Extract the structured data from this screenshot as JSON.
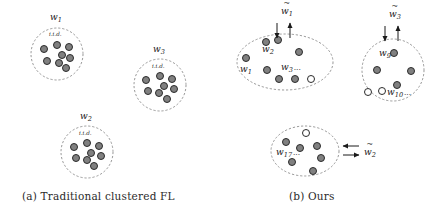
{
  "figure": {
    "type": "diagram",
    "colors": {
      "node_fill": "#808080",
      "node_stroke": "#2b2b2b",
      "node_fill_empty": "#ffffff",
      "boundary_stroke": "#8c8c8c",
      "text": "#1a1a1a",
      "background": "#ffffff"
    }
  },
  "panels": [
    {
      "id": "a",
      "caption": "(a) Traditional clustered FL",
      "clusters": [
        {
          "name": "cluster-w1",
          "label": "w",
          "subscript": "1",
          "inner_label": "i.i.d.",
          "shape": "circle",
          "cx": 57,
          "cy": 54,
          "rx": 26,
          "ry": 26,
          "label_x": 50,
          "label_y": 20,
          "inner_label_x": 49,
          "inner_label_y": 36,
          "nodes": [
            {
              "x": 44,
              "y": 49,
              "fill": "gray"
            },
            {
              "x": 57,
              "y": 45,
              "fill": "gray"
            },
            {
              "x": 69,
              "y": 47,
              "fill": "gray"
            },
            {
              "x": 62,
              "y": 55,
              "fill": "gray"
            },
            {
              "x": 47,
              "y": 61,
              "fill": "gray"
            },
            {
              "x": 59,
              "y": 63,
              "fill": "gray"
            },
            {
              "x": 70,
              "y": 58,
              "fill": "gray"
            },
            {
              "x": 66,
              "y": 68,
              "fill": "gray"
            }
          ]
        },
        {
          "name": "cluster-w3",
          "label": "w",
          "subscript": "3",
          "inner_label": "i.i.d.",
          "shape": "circle",
          "cx": 160,
          "cy": 85,
          "rx": 26,
          "ry": 26,
          "label_x": 153,
          "label_y": 52,
          "inner_label_x": 152,
          "inner_label_y": 68,
          "nodes": [
            {
              "x": 146,
              "y": 80,
              "fill": "gray"
            },
            {
              "x": 160,
              "y": 76,
              "fill": "gray"
            },
            {
              "x": 172,
              "y": 79,
              "fill": "gray"
            },
            {
              "x": 164,
              "y": 86,
              "fill": "gray"
            },
            {
              "x": 148,
              "y": 91,
              "fill": "gray"
            },
            {
              "x": 159,
              "y": 93,
              "fill": "gray"
            },
            {
              "x": 174,
              "y": 89,
              "fill": "gray"
            },
            {
              "x": 167,
              "y": 99,
              "fill": "gray"
            }
          ]
        },
        {
          "name": "cluster-w2",
          "label": "w",
          "subscript": "2",
          "inner_label": "i.i.d.",
          "shape": "circle",
          "cx": 87,
          "cy": 152,
          "rx": 26,
          "ry": 26,
          "label_x": 80,
          "label_y": 119,
          "inner_label_x": 79,
          "inner_label_y": 135,
          "nodes": [
            {
              "x": 74,
              "y": 147,
              "fill": "gray"
            },
            {
              "x": 87,
              "y": 143,
              "fill": "gray"
            },
            {
              "x": 99,
              "y": 146,
              "fill": "gray"
            },
            {
              "x": 91,
              "y": 153,
              "fill": "gray"
            },
            {
              "x": 76,
              "y": 158,
              "fill": "gray"
            },
            {
              "x": 87,
              "y": 160,
              "fill": "gray"
            },
            {
              "x": 101,
              "y": 156,
              "fill": "gray"
            },
            {
              "x": 94,
              "y": 166,
              "fill": "gray"
            }
          ]
        }
      ]
    },
    {
      "id": "b",
      "caption": "(b) Ours",
      "clusters": [
        {
          "name": "cluster-group1",
          "shape": "ellipse",
          "cx": 285,
          "cy": 62,
          "rx": 48,
          "ry": 28,
          "global_label": "w",
          "global_subscript": "1",
          "global_tilde": true,
          "global_label_x": 281,
          "global_label_y": 14,
          "arrow_down_x": 277,
          "arrow_up_x": 290,
          "arrow_top_y": 23,
          "arrow_bottom_y": 38,
          "nodes": [
            {
              "x": 266,
              "y": 42,
              "fill": "gray"
            },
            {
              "x": 278,
              "y": 40,
              "fill": "gray"
            },
            {
              "x": 246,
              "y": 58,
              "fill": "gray"
            },
            {
              "x": 299,
              "y": 52,
              "fill": "gray"
            },
            {
              "x": 267,
              "y": 70,
              "fill": "gray"
            },
            {
              "x": 279,
              "y": 79,
              "fill": "gray"
            },
            {
              "x": 295,
              "y": 79,
              "fill": "gray"
            },
            {
              "x": 311,
              "y": 79,
              "fill": "white"
            }
          ],
          "labels": [
            {
              "name": "node-label-w2",
              "text": "w",
              "sub": "2",
              "x": 262,
              "y": 52
            },
            {
              "name": "node-label-w1",
              "text": "w",
              "sub": "1",
              "x": 240,
              "y": 72
            },
            {
              "name": "node-label-w3",
              "text": "w",
              "sub": "3",
              "suffix": "...",
              "x": 281,
              "y": 70
            }
          ]
        },
        {
          "name": "cluster-group3",
          "shape": "circle",
          "cx": 393,
          "cy": 70,
          "rx": 31,
          "ry": 31,
          "global_label": "w",
          "global_subscript": "3",
          "global_tilde": true,
          "global_label_x": 389,
          "global_label_y": 17,
          "arrow_down_x": 385,
          "arrow_up_x": 398,
          "arrow_top_y": 26,
          "arrow_bottom_y": 41,
          "nodes": [
            {
              "x": 394,
              "y": 53,
              "fill": "gray"
            },
            {
              "x": 377,
              "y": 70,
              "fill": "gray"
            },
            {
              "x": 411,
              "y": 71,
              "fill": "gray"
            },
            {
              "x": 397,
              "y": 85,
              "fill": "gray"
            },
            {
              "x": 368,
              "y": 92,
              "fill": "white"
            },
            {
              "x": 382,
              "y": 91,
              "fill": "white"
            }
          ],
          "labels": [
            {
              "name": "node-label-w9",
              "text": "w",
              "sub": "9",
              "x": 379,
              "y": 56
            },
            {
              "name": "node-label-w10",
              "text": "w",
              "sub": "10",
              "suffix": "...",
              "x": 387,
              "y": 95
            }
          ]
        },
        {
          "name": "cluster-group2",
          "shape": "ellipse",
          "cx": 305,
          "cy": 151,
          "rx": 34,
          "ry": 25,
          "global_label": "w",
          "global_subscript": "2",
          "global_tilde": true,
          "global_label_x": 364,
          "global_label_y": 155,
          "arrow_left_y": 146,
          "arrow_right_y": 155,
          "arrow_start_x": 343,
          "arrow_end_x": 359,
          "nodes": [
            {
              "x": 306,
              "y": 133,
              "fill": "white"
            },
            {
              "x": 286,
              "y": 142,
              "fill": "gray"
            },
            {
              "x": 300,
              "y": 148,
              "fill": "gray"
            },
            {
              "x": 317,
              "y": 146,
              "fill": "gray"
            },
            {
              "x": 321,
              "y": 158,
              "fill": "gray"
            },
            {
              "x": 292,
              "y": 162,
              "fill": "gray"
            },
            {
              "x": 313,
              "y": 171,
              "fill": "gray"
            }
          ],
          "labels": [
            {
              "name": "node-label-w17",
              "text": "w",
              "sub": "17",
              "suffix": "...",
              "x": 276,
              "y": 155
            }
          ]
        }
      ]
    }
  ]
}
